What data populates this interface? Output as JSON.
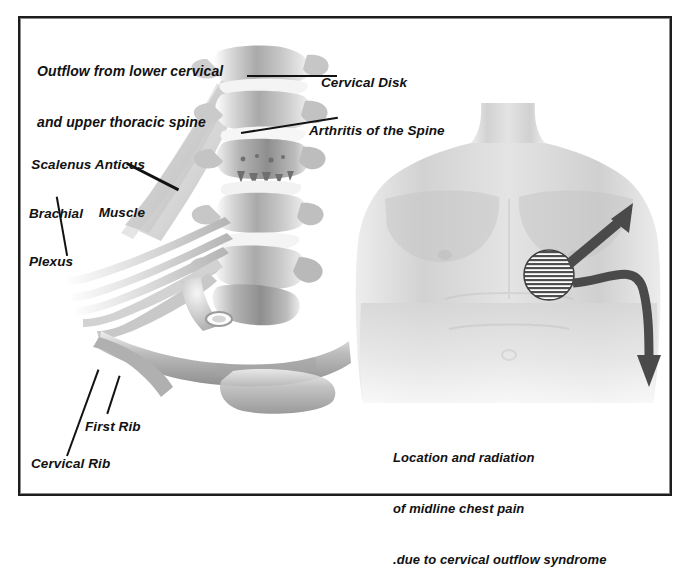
{
  "figure": {
    "title_line1": "Outflow from lower cervical",
    "title_line2": "and upper thoracic spine",
    "background_color": "#ffffff",
    "frame_color": "#1d1d1d",
    "arrow_color": "#4a4a4a",
    "label_color": "#111111"
  },
  "spine_labels": {
    "cervical_disk": "Cervical Disk",
    "arthritis": "Arthritis of the Spine",
    "scalenus_line1": "Scalenus Anticus",
    "scalenus_line2": "Muscle",
    "brachial_line1": "Brachial",
    "brachial_line2": "Plexus",
    "first_rib": "First Rib",
    "cervical_rib": "Cervical Rib"
  },
  "torso_caption": {
    "line1": "Location and radiation",
    "line2": "of midline chest pain",
    "line3": ".due to cervical outflow syndrome"
  },
  "torso_markers": {
    "pain_site": "hatched-circle-pain-site",
    "arrow_up_right": "radiation-arrow-up-right",
    "arrow_down_right": "radiation-arrow-curve-down"
  }
}
